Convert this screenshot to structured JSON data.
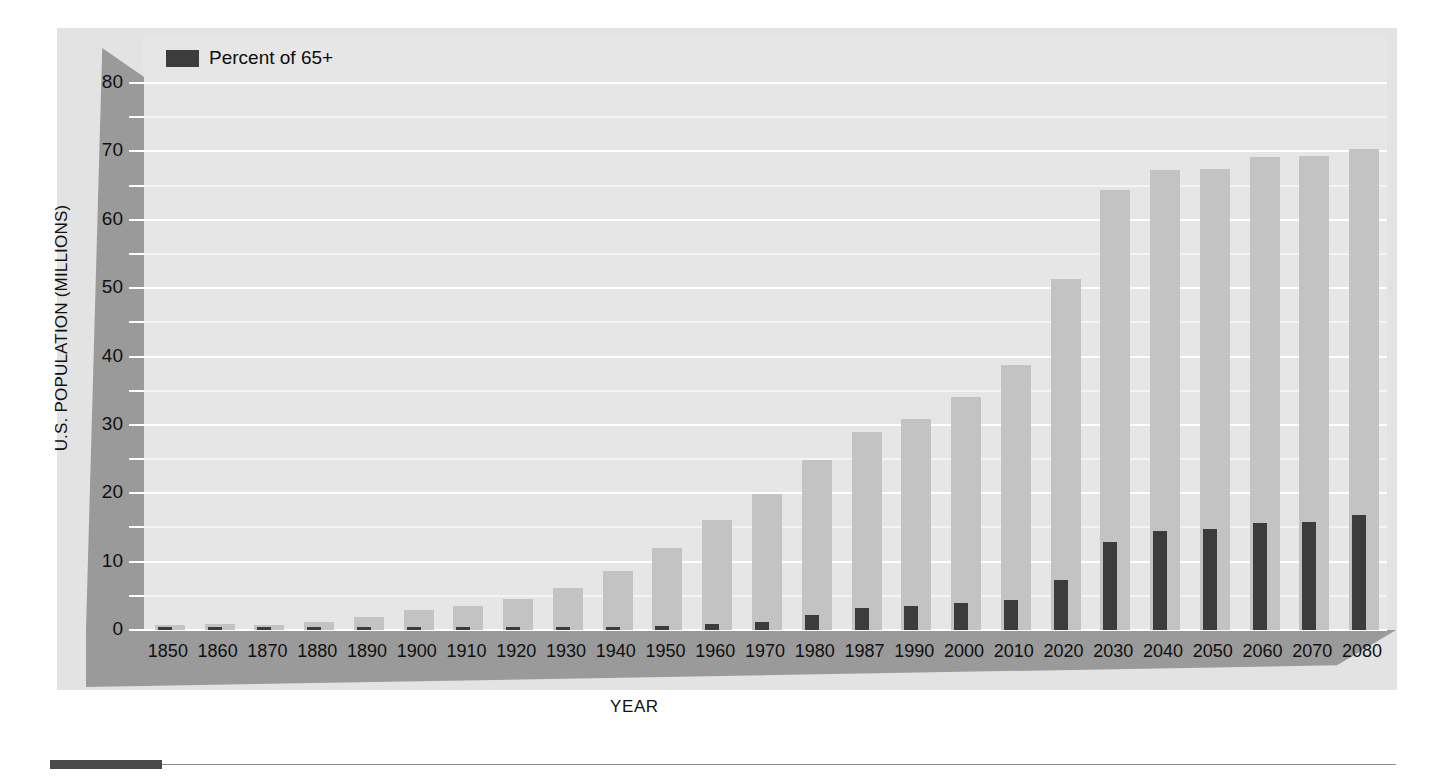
{
  "chart_data": {
    "type": "bar",
    "title": "",
    "xlabel": "YEAR",
    "ylabel": "U.S. POPULATION (MILLIONS)",
    "ylim": [
      0,
      80
    ],
    "yticks": [
      0,
      10,
      20,
      30,
      40,
      50,
      60,
      70,
      80
    ],
    "minor_tick_step": 5,
    "grid": true,
    "legend_position": "top-left",
    "categories": [
      "1850",
      "1860",
      "1870",
      "1880",
      "1890",
      "1900",
      "1910",
      "1920",
      "1930",
      "1940",
      "1950",
      "1960",
      "1970",
      "1980",
      "1987",
      "1990",
      "2000",
      "2010",
      "2020",
      "2030",
      "2040",
      "2050",
      "2060",
      "2070",
      "2080"
    ],
    "series": [
      {
        "name": "Population 65+",
        "color": "#c3c3c3",
        "values": [
          0.8,
          0.9,
          0.8,
          1.1,
          1.9,
          2.9,
          3.5,
          4.5,
          6.2,
          8.6,
          12.0,
          16.1,
          19.9,
          24.9,
          29.0,
          30.9,
          34.1,
          38.7,
          51.4,
          64.3,
          67.3,
          67.4,
          69.2,
          69.3,
          70.3
        ]
      },
      {
        "name": "Percent of 65+",
        "color": "#3c3c3c",
        "values": [
          0.1,
          0.1,
          0.1,
          0.1,
          0.1,
          0.2,
          0.2,
          0.2,
          0.3,
          0.4,
          0.6,
          0.9,
          1.2,
          2.2,
          3.2,
          3.5,
          3.9,
          4.4,
          7.3,
          12.8,
          14.5,
          14.8,
          15.7,
          15.8,
          16.8
        ]
      }
    ]
  },
  "legend": {
    "label": "Percent of 65+",
    "swatch_color": "#3c3c3c"
  },
  "axes": {
    "y_title": "U.S. POPULATION (MILLIONS)",
    "x_title": "YEAR"
  },
  "colors": {
    "panel": "#e3e3e3",
    "plot": "#e6e6e6",
    "wall": "#9a9a9a",
    "bar_total": "#c3c3c3",
    "bar_elderly": "#3c3c3c",
    "gridline": "#ffffff",
    "rule": "#4a4a4a"
  }
}
